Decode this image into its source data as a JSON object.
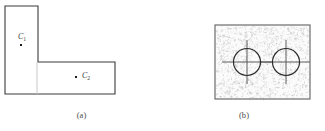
{
  "figure": {
    "panels": [
      {
        "id": "a",
        "caption": "(a)",
        "kind": "line-drawing",
        "description": "L-shaped polygon outline with two interior marked points",
        "shape": {
          "name": "L-shape",
          "stroke_color": "#3a3a3a",
          "fill_color": "#ffffff",
          "stroke_width": 1.1,
          "vertices": [
            [
              5,
              6
            ],
            [
              38,
              6
            ],
            [
              38,
              62
            ],
            [
              115,
              62
            ],
            [
              115,
              94
            ],
            [
              5,
              94
            ]
          ],
          "internal_divider": {
            "name": "vertical-dashed-divider",
            "x": 37,
            "y1": 62,
            "y2": 94,
            "color": "#c9c9c9",
            "style": "solid-faint"
          }
        },
        "points": [
          {
            "id": "c1",
            "label": "C",
            "subscript": "1",
            "x": 20.6,
            "y": 45.1
          },
          {
            "id": "c2",
            "label": "C",
            "subscript": "2",
            "x": 76.1,
            "y": 77.1
          }
        ]
      },
      {
        "id": "b",
        "caption": "(b)",
        "kind": "speckle-image",
        "description": "Rectangular speckle-texture patch containing two circles with crosshair markers",
        "rect": {
          "name": "speckle-rectangle",
          "x": 215,
          "y": 25,
          "width": 95,
          "height": 74,
          "border_color": "#6d6d6d",
          "border_width": 1.2,
          "fill_color": "#fbfbfb",
          "speckle_color": "#8e8e8e",
          "speckle_count": 1400
        },
        "circles": [
          {
            "id": "circle-1",
            "cx": 247,
            "cy": 62,
            "r": 13.5,
            "stroke_color": "#2b2b2b",
            "stroke_width": 1.2,
            "crosshair": {
              "name": "crosshair-marker",
              "h_half_length": 25,
              "v_half_length": 22,
              "color": "#4a4a4a",
              "width": 0.9
            }
          },
          {
            "id": "circle-2",
            "cx": 286,
            "cy": 62,
            "r": 13.5,
            "stroke_color": "#2b2b2b",
            "stroke_width": 1.2,
            "crosshair": {
              "name": "crosshair-marker",
              "h_half_length": 25,
              "v_half_length": 22,
              "color": "#4a4a4a",
              "width": 0.9
            }
          }
        ]
      }
    ]
  }
}
